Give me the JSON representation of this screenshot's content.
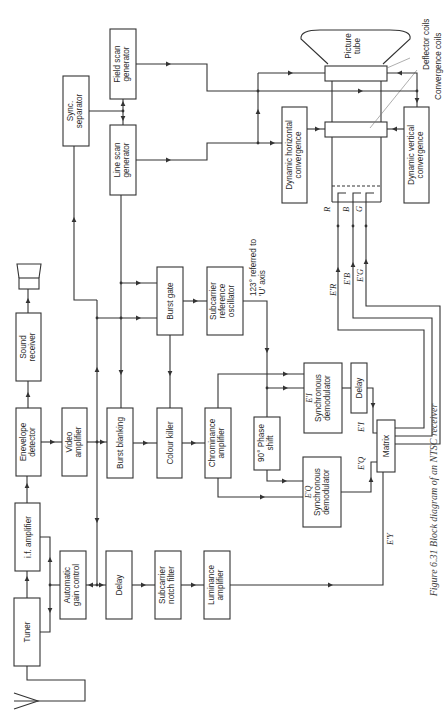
{
  "figure": {
    "caption": "Figure 6.31  Block diagram of an NTSC receiver",
    "orientation": "rotated 90 degrees counter-clockwise"
  },
  "blocks": {
    "tuner": [
      "Tuner"
    ],
    "if_amp": [
      "i.f. amplifier"
    ],
    "envelope": [
      "Enevelope",
      "detector"
    ],
    "sound": [
      "Sound",
      "receiver"
    ],
    "agc": [
      "Automatic",
      "gain control"
    ],
    "video_amp": [
      "Video",
      "amplifier"
    ],
    "sync_sep": [
      "Sync.",
      "separator"
    ],
    "field_scan": [
      "Field scan",
      "generator"
    ],
    "line_scan": [
      "Line scan",
      "generator"
    ],
    "burst_blank": [
      "Burst blanking"
    ],
    "burst_gate": [
      "Burst gate"
    ],
    "delay1": [
      "Delay"
    ],
    "colour_killer": [
      "Colour killer"
    ],
    "subcarrier_osc": [
      "Subcarrier",
      "reference",
      "oscillator"
    ],
    "notch": [
      "Subcarrier",
      "notch filter"
    ],
    "chroma_amp": [
      "Chrominance",
      "amplifier"
    ],
    "phase_shift": [
      "90° Phase",
      "shift"
    ],
    "lum_amp": [
      "Luminance",
      "amplifier"
    ],
    "sync_demod_i": [
      "E'I",
      "Synchronous",
      "demodulator"
    ],
    "sync_demod_q": [
      "E'Q",
      "Synchronous",
      "demodulator"
    ],
    "delay2": [
      "Delay"
    ],
    "matrix": [
      "Matrix"
    ],
    "dyn_h": [
      "Dynamic horizontal",
      "convergence"
    ],
    "dyn_v": [
      "Dynamic vertical",
      "convergence"
    ],
    "picture_tube": [
      "Picture",
      "tube"
    ]
  },
  "labels": {
    "phase_note": [
      "123° referred to",
      "'U' axis"
    ],
    "deflector": "Deflector coils",
    "convergence": "Convergence coils",
    "ei": "E'I",
    "eq": "E'Q",
    "ey": "E'Y",
    "er": "E'R",
    "eb": "E'B",
    "eg": "E'G",
    "r": "R",
    "b": "B",
    "g": "G"
  },
  "icons": {
    "antenna": "antenna-icon",
    "speaker": "speaker-icon"
  }
}
